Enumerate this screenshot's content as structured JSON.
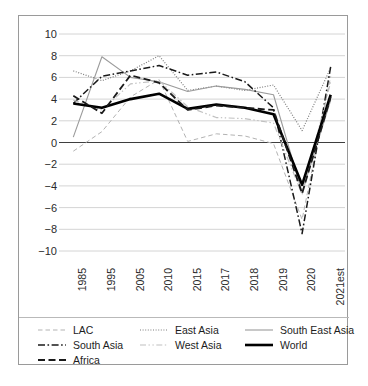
{
  "chart_data": {
    "type": "line",
    "title": "",
    "subtitle": "",
    "xlabel": "",
    "ylabel": "",
    "categories": [
      "1985",
      "1995",
      "2005",
      "2010",
      "2015",
      "2017",
      "2018",
      "2019",
      "2020",
      "2021est"
    ],
    "ylim": [
      -10,
      10
    ],
    "y_ticks": [
      "10",
      "8",
      "6",
      "4",
      "2",
      "0",
      "−2",
      "−4",
      "−6",
      "−8",
      "−10"
    ],
    "y_tick_values": [
      10,
      8,
      6,
      4,
      2,
      0,
      -2,
      -4,
      -6,
      -8,
      -10
    ],
    "grid": true,
    "grid_axis": "y",
    "legend_position": "bottom",
    "zero_line": true,
    "series": [
      {
        "name": "LAC",
        "style": "dashed",
        "color": "#b3b3b3",
        "width": 1,
        "values": [
          -0.8,
          1.0,
          4.2,
          5.8,
          0.1,
          0.8,
          0.6,
          -0.1,
          -7.1,
          6.1
        ]
      },
      {
        "name": "East Asia",
        "style": "dotted",
        "color": "#7d7d7d",
        "width": 1.2,
        "values": [
          6.6,
          5.7,
          6.6,
          8.0,
          4.8,
          5.2,
          4.8,
          5.3,
          1.1,
          6.9
        ]
      },
      {
        "name": "South East Asia",
        "style": "solid",
        "color": "#9b9b9b",
        "width": 1.1,
        "values": [
          0.5,
          7.9,
          6.0,
          5.6,
          4.7,
          5.2,
          4.9,
          4.4,
          -4.6,
          3.9
        ]
      },
      {
        "name": "South Asia",
        "style": "dashdot",
        "color": "#1a1a1a",
        "width": 1.5,
        "values": [
          3.6,
          6.1,
          6.6,
          7.1,
          6.2,
          6.5,
          5.6,
          3.2,
          -8.4,
          7.0
        ]
      },
      {
        "name": "West Asia",
        "style": "dashdotdot",
        "color": "#c0c0c0",
        "width": 1.2,
        "values": [
          3.9,
          3.0,
          5.4,
          5.7,
          3.3,
          2.3,
          2.2,
          1.8,
          -4.8,
          5.6
        ]
      },
      {
        "name": "World",
        "style": "solid",
        "color": "#000000",
        "width": 2.6,
        "values": [
          3.6,
          3.2,
          4.0,
          4.5,
          3.1,
          3.5,
          3.2,
          2.6,
          -3.9,
          4.4
        ]
      },
      {
        "name": "Africa",
        "style": "longdash",
        "color": "#1a1a1a",
        "width": 1.8,
        "values": [
          4.3,
          2.7,
          6.2,
          5.5,
          3.0,
          3.4,
          3.2,
          3.0,
          -4.7,
          4.2
        ]
      }
    ]
  },
  "legend": {
    "rows": [
      [
        {
          "label": "LAC",
          "style": "dashed",
          "color": "#b3b3b3",
          "width": 1
        },
        {
          "label": "East Asia",
          "style": "dotted",
          "color": "#7d7d7d",
          "width": 1.2
        },
        {
          "label": "South East Asia",
          "style": "solid",
          "color": "#9b9b9b",
          "width": 1.1
        }
      ],
      [
        {
          "label": "South Asia",
          "style": "dashdot",
          "color": "#1a1a1a",
          "width": 1.5
        },
        {
          "label": "West Asia",
          "style": "dashdotdot",
          "color": "#c0c0c0",
          "width": 1.2
        },
        {
          "label": "World",
          "style": "solid",
          "color": "#000000",
          "width": 2.6
        }
      ],
      [
        {
          "label": "Africa",
          "style": "longdash",
          "color": "#1a1a1a",
          "width": 1.8
        }
      ]
    ]
  },
  "colors": {
    "frame": "#9a9a9a",
    "gridline": "#d4d4d4",
    "zero_line": "#3f3f3f",
    "text": "#2b2b2b",
    "background": "#ffffff"
  }
}
